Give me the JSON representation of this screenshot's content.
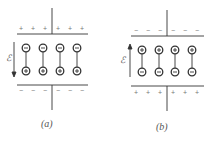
{
  "panels": [
    {
      "id": "a",
      "caption": "(a)",
      "field_label": "ℰ",
      "field_direction": "down",
      "top_plate_sign": "+",
      "bottom_plate_sign": "−",
      "dipoles": [
        {
          "top": "−",
          "bottom": "+"
        },
        {
          "top": "−",
          "bottom": "+"
        },
        {
          "top": "−",
          "bottom": "+"
        },
        {
          "top": "−",
          "bottom": "+"
        }
      ]
    },
    {
      "id": "b",
      "caption": "(b)",
      "field_label": "ℰ",
      "field_direction": "up",
      "top_plate_sign": "−",
      "bottom_plate_sign": "+",
      "dipoles": [
        {
          "top": "+",
          "bottom": "−"
        },
        {
          "top": "+",
          "bottom": "−"
        },
        {
          "top": "+",
          "bottom": "−"
        },
        {
          "top": "+",
          "bottom": "−"
        }
      ]
    }
  ],
  "colors": {
    "line": "#333333",
    "text": "#555555"
  }
}
